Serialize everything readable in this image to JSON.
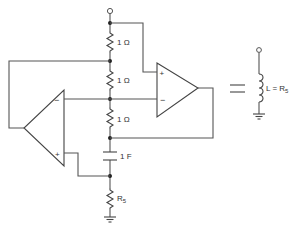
{
  "colors": {
    "line": "#555555",
    "text": "#333333",
    "background": "#ffffff"
  },
  "components": {
    "r1": {
      "label": "1 Ω",
      "value": "1 Ω"
    },
    "r2": {
      "label": "1 Ω",
      "value": "1 Ω"
    },
    "r3": {
      "label": "1 Ω",
      "value": "1 Ω"
    },
    "c1": {
      "label": "1 F",
      "value": "1 F"
    },
    "r5": {
      "label_main": "R",
      "label_sub": "5"
    }
  },
  "opamps": {
    "right": {
      "plus": "+",
      "minus": "−"
    },
    "left": {
      "plus": "+",
      "minus": "−"
    }
  },
  "equivalence": {
    "symbol": "=",
    "inductor_label_main": "L = R",
    "inductor_label_sub": "5"
  }
}
